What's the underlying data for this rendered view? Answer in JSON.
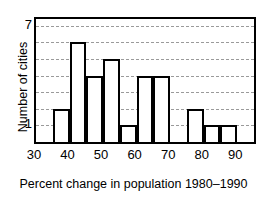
{
  "chart_data": {
    "type": "bar",
    "title": "",
    "subtitle": "",
    "caption": "Percent change in population 1980–1990",
    "xlabel": "Percent change in population 1980–1990",
    "ylabel": "Number of cities",
    "xlim": [
      30,
      95
    ],
    "ylim": [
      0,
      7.4
    ],
    "bin_width": 5,
    "grid": true,
    "grid_axis": "y",
    "legend": "none",
    "xticks": [
      30,
      40,
      50,
      60,
      70,
      80,
      90
    ],
    "xtick_labels": [
      "30",
      "40",
      "50",
      "60",
      "70",
      "80",
      "90"
    ],
    "yticks": [
      1,
      2,
      3,
      4,
      5,
      6,
      7
    ],
    "ytick_labels": [
      "1",
      "",
      "",
      "",
      "",
      "",
      "7"
    ],
    "categories": [
      "30–35",
      "35–40",
      "40–45",
      "45–50",
      "50–55",
      "55–60",
      "60–65",
      "65–70",
      "70–75",
      "75–80",
      "80–85",
      "85–90",
      "90–95"
    ],
    "bin_edges": [
      30,
      35,
      40,
      45,
      50,
      55,
      60,
      65,
      70,
      75,
      80,
      85,
      90,
      95
    ],
    "values": [
      0,
      2,
      6,
      4,
      5,
      1,
      4,
      4,
      0,
      2,
      1,
      1,
      0
    ],
    "bar_face_color": "#ffffff",
    "bar_edge_color": "#000000",
    "grid_color": "#9a9a9a",
    "axis_color": "#000000",
    "background_color": "#ffffff"
  }
}
